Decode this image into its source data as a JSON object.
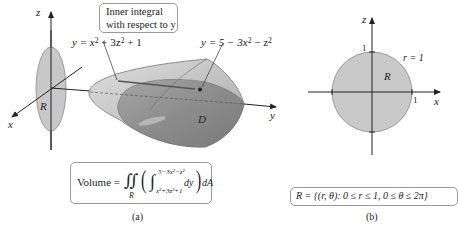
{
  "figure_a": {
    "caption": "(a)",
    "axis_labels": {
      "x": "x",
      "y": "y",
      "z": "z"
    },
    "region_label": "R",
    "solid_label": "D",
    "note": {
      "line1": "Inner integral",
      "line2": "with respect to y"
    },
    "lower_surface": {
      "lhs": "y = x",
      "mid": " + 3z",
      "rhs": " + 1"
    },
    "upper_surface": {
      "lhs": "y = 5 − 3x",
      "mid": " − z",
      "rhs": ""
    },
    "volume_formula": {
      "lhs": "Volume = ",
      "double_integral": "∬",
      "region": "R",
      "upper_limit": "5−3x²−z²",
      "lower_limit": "x²+3z²+1",
      "integrand": "dy",
      "outer": "dA"
    }
  },
  "figure_b": {
    "caption": "(b)",
    "axis_labels": {
      "x": "x",
      "z": "z"
    },
    "region_label": "R",
    "circle_label": "r = 1",
    "tick_x": "1",
    "tick_z": "1",
    "region_definition": "R = {(r, θ): 0 ≤ r ≤ 1, 0 ≤ θ ≤ 2π}"
  },
  "colors": {
    "region_fill": "#c9c9c9",
    "solid_light": "#d4d4d4",
    "solid_dark": "#8f8f8f",
    "axis": "#222222"
  }
}
